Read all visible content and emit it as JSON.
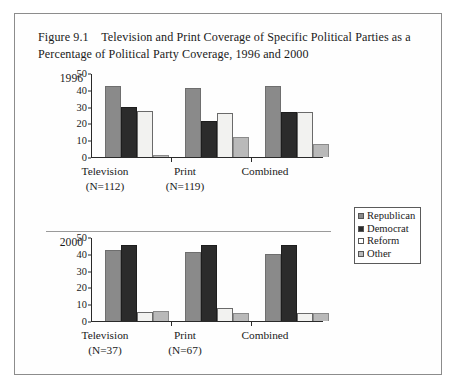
{
  "figure": {
    "caption_number": "Figure 9.1",
    "caption_line1": "Television and Print Coverage of Specific Political",
    "caption_line2": "Parties as a Percentage of Political Party Coverage, 1996 and 2000"
  },
  "legend": {
    "items": [
      {
        "label": "Republican",
        "color": "#8a8a8a",
        "swatch": "legend-swatch-republican"
      },
      {
        "label": "Democrat",
        "color": "#2b2b2b",
        "swatch": "legend-swatch-democrat"
      },
      {
        "label": "Reform",
        "color": "#ffffff",
        "swatch": "legend-swatch-reform"
      },
      {
        "label": "Other",
        "color": "#b9b9b9",
        "swatch": "legend-swatch-other"
      }
    ]
  },
  "panels": [
    {
      "year": "1996",
      "categories": [
        "Television",
        "Print",
        "Combined"
      ],
      "n_labels": [
        "(N=112)",
        "(N=119)",
        ""
      ]
    },
    {
      "year": "2000",
      "categories": [
        "Television",
        "Print",
        "Combined"
      ],
      "n_labels": [
        "(N=37)",
        "(N=67)",
        ""
      ]
    }
  ],
  "y_axis": {
    "ticks": [
      "0",
      "10",
      "20",
      "30",
      "40",
      "50"
    ],
    "min": 0,
    "max": 50
  },
  "chart_data": [
    {
      "type": "bar",
      "title": "1996",
      "panel": "1996",
      "xlabel": "",
      "ylabel": "",
      "ylim": [
        0,
        50
      ],
      "yticks": [
        0,
        10,
        20,
        30,
        40,
        50
      ],
      "grid": false,
      "legend_position": "right",
      "categories": [
        "Television",
        "Print",
        "Combined"
      ],
      "category_notes": [
        "(N=112)",
        "(N=119)",
        ""
      ],
      "series": [
        {
          "name": "Republican",
          "color": "#8a8a8a",
          "values": [
            42,
            41,
            42
          ]
        },
        {
          "name": "Democrat",
          "color": "#2b2b2b",
          "values": [
            30,
            21.5,
            26.5
          ]
        },
        {
          "name": "Reform",
          "color": "#ffffff",
          "values": [
            27.5,
            26,
            26.5
          ]
        },
        {
          "name": "Other",
          "color": "#b9b9b9",
          "values": [
            1,
            12,
            8
          ]
        }
      ]
    },
    {
      "type": "bar",
      "title": "2000",
      "panel": "2000",
      "xlabel": "",
      "ylabel": "",
      "ylim": [
        0,
        50
      ],
      "yticks": [
        0,
        10,
        20,
        30,
        40,
        50
      ],
      "grid": false,
      "legend_position": "right",
      "categories": [
        "Television",
        "Print",
        "Combined"
      ],
      "category_notes": [
        "(N=37)",
        "(N=67)",
        ""
      ],
      "series": [
        {
          "name": "Republican",
          "color": "#8a8a8a",
          "values": [
            42,
            41,
            40
          ]
        },
        {
          "name": "Democrat",
          "color": "#2b2b2b",
          "values": [
            45.5,
            45.5,
            45
          ]
        },
        {
          "name": "Reform",
          "color": "#ffffff",
          "values": [
            5.5,
            8,
            5
          ]
        },
        {
          "name": "Other",
          "color": "#b9b9b9",
          "values": [
            6,
            4.5,
            5
          ]
        }
      ]
    }
  ]
}
